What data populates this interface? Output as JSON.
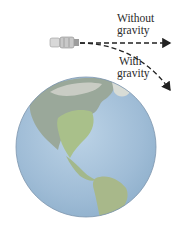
{
  "diagram": {
    "labels": {
      "without_line1": "Without",
      "without_line2": "gravity",
      "with_line1": "With",
      "with_line2": "gravity"
    },
    "objects": [
      "satellite",
      "earth",
      "straight-path-arrow",
      "curved-path-arrow"
    ],
    "colors": {
      "ocean": "#a9c4dc",
      "land": "#a8b98a",
      "arrow": "#222222"
    }
  }
}
